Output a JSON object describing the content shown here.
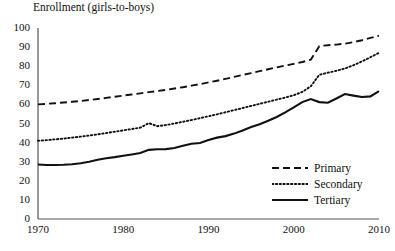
{
  "chart_data": {
    "type": "line",
    "title": "Enrollment (girls-to-boys)",
    "xlabel": "",
    "ylabel": "",
    "xlim": [
      1970,
      2010
    ],
    "ylim": [
      0,
      100
    ],
    "grid": false,
    "legend_position": "bottom-right-inside",
    "x_ticks": [
      "1970",
      "1980",
      "1990",
      "2000",
      "2010"
    ],
    "y_ticks": [
      "0",
      "10",
      "20",
      "30",
      "40",
      "50",
      "60",
      "70",
      "80",
      "90",
      "100"
    ],
    "x": [
      1970,
      1971,
      1972,
      1973,
      1974,
      1975,
      1976,
      1977,
      1978,
      1979,
      1980,
      1981,
      1982,
      1983,
      1984,
      1985,
      1986,
      1987,
      1988,
      1989,
      1990,
      1991,
      1992,
      1993,
      1994,
      1995,
      1996,
      1997,
      1998,
      1999,
      2000,
      2001,
      2002,
      2003,
      2004,
      2005,
      2006,
      2007,
      2008,
      2009,
      2010
    ],
    "series": [
      {
        "name": "Primary",
        "style": "dashed",
        "color": "#111111",
        "values": [
          60,
          60.3,
          60.6,
          61,
          61.4,
          61.8,
          62.3,
          62.8,
          63.4,
          64,
          64.6,
          65.2,
          65.8,
          66.4,
          67,
          67.6,
          68.3,
          69,
          69.8,
          70.6,
          71.5,
          72.4,
          73.4,
          74.4,
          75.4,
          76.4,
          77.4,
          78.4,
          79.4,
          80.3,
          81.2,
          82.2,
          83.4,
          90.5,
          91,
          91.3,
          91.8,
          92.6,
          93.6,
          94.8,
          96
        ]
      },
      {
        "name": "Secondary",
        "style": "dotted",
        "color": "#111111",
        "values": [
          41,
          41.3,
          41.7,
          42.1,
          42.6,
          43.1,
          43.7,
          44.3,
          45,
          45.7,
          46.4,
          47.1,
          47.8,
          50.2,
          48.6,
          49.2,
          50,
          50.9,
          51.8,
          52.8,
          53.8,
          54.8,
          55.9,
          57,
          58.1,
          59.2,
          60.3,
          61.4,
          62.5,
          63.6,
          64.8,
          66.5,
          69.5,
          75.5,
          76.6,
          77.6,
          78.8,
          80.5,
          82.5,
          84.7,
          87
        ]
      },
      {
        "name": "Tertiary",
        "style": "solid",
        "color": "#111111",
        "values": [
          28.5,
          28.3,
          28.3,
          28.4,
          28.7,
          29.2,
          30,
          31,
          31.8,
          32.4,
          33.1,
          33.8,
          34.6,
          36.2,
          36.5,
          36.6,
          37.2,
          38.3,
          39.4,
          39.8,
          41.4,
          42.6,
          43.4,
          44.7,
          46.3,
          48.2,
          49.6,
          51.4,
          53.4,
          55.8,
          58.4,
          61.2,
          62.8,
          61.2,
          60.9,
          63.1,
          65.4,
          64.6,
          63.9,
          64.2,
          67
        ]
      }
    ]
  },
  "legend": {
    "items": [
      {
        "label": "Primary"
      },
      {
        "label": "Secondary"
      },
      {
        "label": "Tertiary"
      }
    ]
  },
  "y_axis": {
    "ticks": [
      "100",
      "90",
      "80",
      "70",
      "60",
      "50",
      "40",
      "30",
      "20",
      "10",
      "0"
    ]
  },
  "x_axis": {
    "ticks": [
      "1970",
      "1980",
      "1990",
      "2000",
      "2010"
    ]
  }
}
